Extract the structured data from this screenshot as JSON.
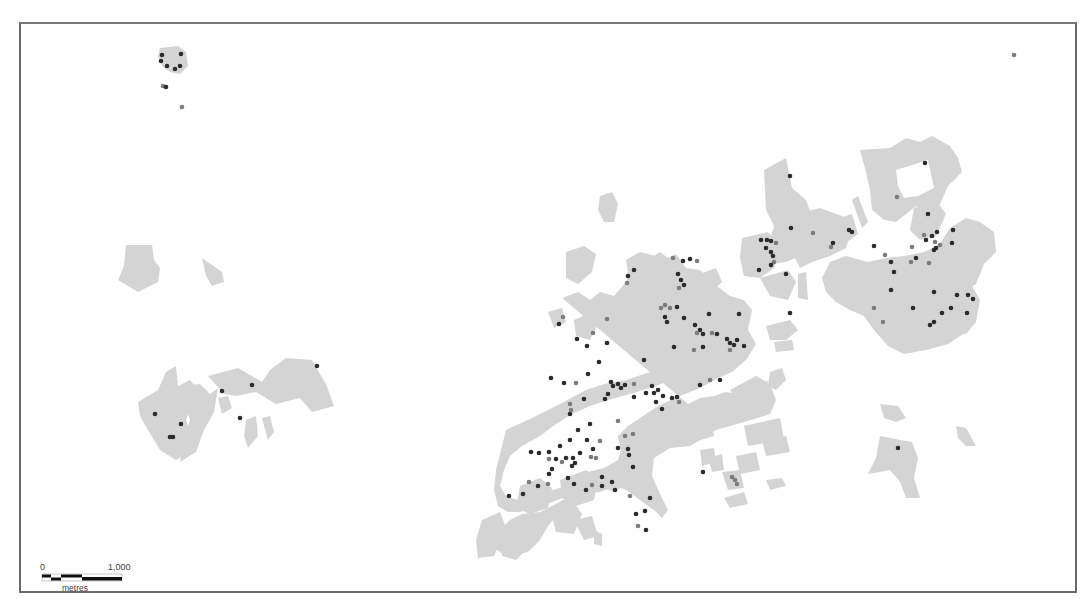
{
  "map": {
    "type": "thematic point map over land parcels",
    "frame": {
      "border_color": "#6a6a6a"
    },
    "colors": {
      "parcel_fill": "#d4d4d4",
      "point_dark": "#2b2b2b",
      "point_mid": "#7d7d7d",
      "background": "#ffffff"
    },
    "scale_bar": {
      "start_label": "0",
      "end_label": "1,000",
      "unit_label": "metres"
    },
    "clusters": [
      {
        "name": "north-west hamlet",
        "approx_center": [
          170,
          65
        ]
      },
      {
        "name": "west settlement",
        "approx_center": [
          230,
          390
        ]
      },
      {
        "name": "central town",
        "approx_center": [
          620,
          400
        ]
      },
      {
        "name": "north-east district",
        "approx_center": [
          880,
          250
        ]
      },
      {
        "name": "south-east outlier",
        "approx_center": [
          900,
          460
        ]
      }
    ]
  }
}
